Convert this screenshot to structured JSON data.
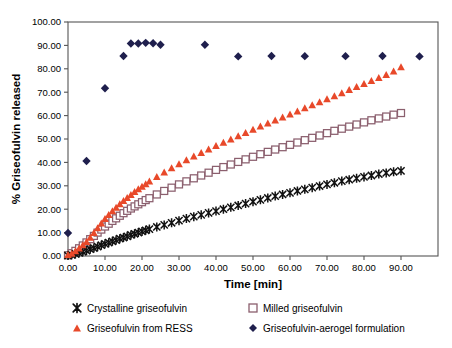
{
  "chart_data": {
    "type": "scatter",
    "title": "",
    "xlabel": "Time [min]",
    "ylabel": "% Griseofulvin released",
    "xlim": [
      0,
      100
    ],
    "ylim": [
      0,
      100
    ],
    "grid": false,
    "legend_position": "bottom",
    "xticks": [
      "0.00",
      "10.00",
      "20.00",
      "30.00",
      "40.00",
      "50.00",
      "60.00",
      "70.00",
      "80.00",
      "90.00"
    ],
    "xtick_values": [
      0,
      10,
      20,
      30,
      40,
      50,
      60,
      70,
      80,
      90
    ],
    "yticks": [
      "0.00",
      "10.00",
      "20.00",
      "30.00",
      "40.00",
      "50.00",
      "60.00",
      "70.00",
      "80.00",
      "90.00",
      "100.00"
    ],
    "ytick_values": [
      0,
      10,
      20,
      30,
      40,
      50,
      60,
      70,
      80,
      90,
      100
    ],
    "series": [
      {
        "name": "Crystalline griseofulvin",
        "marker": "x-star",
        "color": "#111111",
        "x": [
          0,
          1,
          2,
          3,
          4,
          5,
          6,
          7,
          8,
          9,
          10,
          11,
          12,
          13,
          14,
          15,
          16,
          17,
          18,
          19,
          20,
          21,
          22,
          24,
          26,
          28,
          30,
          32,
          34,
          36,
          38,
          40,
          42,
          44,
          46,
          48,
          50,
          52,
          54,
          56,
          58,
          60,
          62,
          64,
          66,
          68,
          70,
          72,
          74,
          76,
          78,
          80,
          82,
          84,
          86,
          88,
          90
        ],
        "y": [
          0.2,
          0.5,
          0.9,
          1.3,
          1.8,
          2.3,
          2.9,
          3.4,
          4.0,
          4.6,
          5.2,
          5.7,
          6.3,
          6.8,
          7.4,
          7.9,
          8.4,
          9.0,
          9.5,
          10.0,
          10.5,
          11.0,
          11.5,
          12.4,
          13.3,
          14.2,
          15.1,
          16.0,
          16.8,
          17.6,
          18.4,
          19.2,
          20.0,
          20.8,
          21.6,
          22.4,
          23.2,
          24.0,
          24.8,
          25.6,
          26.3,
          27.0,
          27.8,
          28.5,
          29.2,
          29.9,
          30.6,
          31.3,
          32.0,
          32.6,
          33.2,
          33.8,
          34.4,
          35.0,
          35.5,
          36.0,
          36.4
        ]
      },
      {
        "name": "Milled griseofulvin",
        "marker": "open-square",
        "color": "#8B5F6E",
        "x": [
          0,
          1,
          2,
          3,
          4,
          5,
          6,
          7,
          8,
          9,
          10,
          11,
          12,
          13,
          14,
          15,
          16,
          17,
          18,
          19,
          20,
          21,
          22,
          24,
          26,
          28,
          30,
          32,
          34,
          36,
          38,
          40,
          42,
          44,
          46,
          48,
          50,
          52,
          54,
          56,
          58,
          60,
          62,
          64,
          66,
          68,
          70,
          72,
          74,
          76,
          78,
          80,
          82,
          84,
          86,
          88,
          90
        ],
        "y": [
          0.3,
          1.2,
          2.2,
          3.3,
          4.5,
          5.8,
          7.2,
          8.6,
          10.0,
          11.3,
          12.6,
          13.8,
          15.0,
          16.1,
          17.2,
          18.3,
          19.3,
          20.3,
          21.2,
          22.1,
          23.0,
          23.9,
          24.7,
          26.3,
          27.8,
          29.2,
          30.6,
          31.9,
          33.2,
          34.4,
          35.6,
          36.8,
          38.0,
          39.1,
          40.2,
          41.3,
          42.4,
          43.5,
          44.5,
          45.5,
          46.5,
          47.5,
          48.5,
          49.5,
          50.5,
          51.5,
          52.5,
          53.5,
          54.4,
          55.3,
          56.2,
          57.1,
          58.0,
          58.8,
          59.6,
          60.4,
          61.1
        ]
      },
      {
        "name": "Griseofulvin from RESS",
        "marker": "filled-triangle",
        "color": "#E8492A",
        "x": [
          0,
          1,
          2,
          3,
          4,
          5,
          6,
          7,
          8,
          9,
          10,
          11,
          12,
          13,
          14,
          15,
          16,
          17,
          18,
          19,
          20,
          21,
          22,
          24,
          26,
          28,
          30,
          32,
          34,
          36,
          38,
          40,
          42,
          44,
          46,
          48,
          50,
          52,
          54,
          56,
          58,
          60,
          62,
          64,
          66,
          68,
          70,
          72,
          74,
          76,
          78,
          80,
          82,
          84,
          86,
          88,
          90
        ],
        "y": [
          0.4,
          1.0,
          2.0,
          3.2,
          4.6,
          6.0,
          7.8,
          9.8,
          11.9,
          13.9,
          15.8,
          17.5,
          19.1,
          20.6,
          22.1,
          23.5,
          24.8,
          26.1,
          27.3,
          28.5,
          29.6,
          30.7,
          31.8,
          33.8,
          35.7,
          37.5,
          39.2,
          40.9,
          42.5,
          44.0,
          45.5,
          47.0,
          48.4,
          49.8,
          51.2,
          52.6,
          54.0,
          55.3,
          56.6,
          57.9,
          59.2,
          60.5,
          61.8,
          63.1,
          64.4,
          65.7,
          67.0,
          68.3,
          69.6,
          70.9,
          72.2,
          73.5,
          74.8,
          76.1,
          77.4,
          78.8,
          80.7
        ]
      },
      {
        "name": "Griseofulvin-aerogel formulation",
        "marker": "filled-diamond",
        "color": "#1F1F4D",
        "x": [
          0,
          5,
          10,
          15,
          17,
          19,
          21,
          23,
          25,
          37,
          46,
          55,
          64,
          75,
          85,
          95
        ],
        "y": [
          9.8,
          40.6,
          71.7,
          85.5,
          90.8,
          90.8,
          91.1,
          90.9,
          90.3,
          90.3,
          85.3,
          85.5,
          85.4,
          85.4,
          85.5,
          85.3
        ]
      }
    ]
  },
  "legend": {
    "items": [
      {
        "label": "Crystalline griseofulvin",
        "marker": "x-star-icon",
        "color": "#111111"
      },
      {
        "label": "Milled griseofulvin",
        "marker": "open-square-icon",
        "color": "#8B5F6E"
      },
      {
        "label": "Griseofulvin from RESS",
        "marker": "filled-triangle-icon",
        "color": "#E8492A"
      },
      {
        "label": "Griseofulvin-aerogel formulation",
        "marker": "filled-diamond-icon",
        "color": "#1F1F4D"
      }
    ]
  }
}
